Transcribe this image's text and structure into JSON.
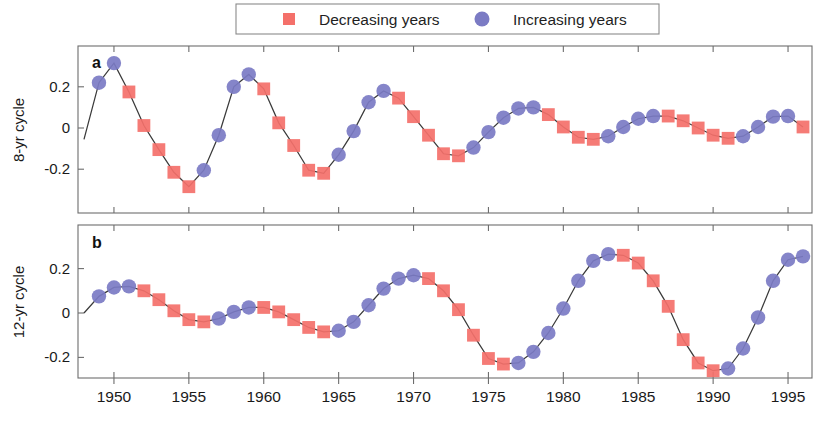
{
  "legend": {
    "entries": [
      {
        "label": "Decreasing years",
        "marker": "square-marker",
        "color": "#F4706A"
      },
      {
        "label": "Increasing years",
        "marker": "circle-marker",
        "color": "#7B7BC4"
      }
    ]
  },
  "axis": {
    "x_ticklabels": [
      "1950",
      "1955",
      "1960",
      "1965",
      "1970",
      "1975",
      "1980",
      "1985",
      "1990",
      "1995"
    ],
    "x_tickvalues": [
      1950,
      1955,
      1960,
      1965,
      1970,
      1975,
      1980,
      1985,
      1990,
      1995
    ],
    "y_ticklabels": [
      "0.2",
      "0",
      "-0.2"
    ],
    "y_tickvalues": [
      0.2,
      0,
      -0.2
    ]
  },
  "chart_data": [
    {
      "type": "line",
      "panel": "a",
      "panel_label": "a",
      "title": "",
      "xlabel": "",
      "ylabel": "8-yr cycle",
      "xlim": [
        1947.6,
        1996.6
      ],
      "ylim": [
        -0.355,
        0.395
      ],
      "grid": false,
      "legend_position": "top-center",
      "x": [
        1948,
        1949,
        1950,
        1951,
        1952,
        1953,
        1954,
        1955,
        1956,
        1957,
        1958,
        1959,
        1960,
        1961,
        1962,
        1963,
        1964,
        1965,
        1966,
        1967,
        1968,
        1969,
        1970,
        1971,
        1972,
        1973,
        1974,
        1975,
        1976,
        1977,
        1978,
        1979,
        1980,
        1981,
        1982,
        1983,
        1984,
        1985,
        1986,
        1987,
        1988,
        1989,
        1990,
        1991,
        1992,
        1993,
        1994,
        1995,
        1996
      ],
      "y": [
        -0.055,
        0.22,
        0.315,
        0.175,
        0.012,
        -0.105,
        -0.215,
        -0.285,
        -0.205,
        -0.035,
        0.2,
        0.26,
        0.19,
        0.025,
        -0.085,
        -0.205,
        -0.22,
        -0.13,
        -0.015,
        0.125,
        0.18,
        0.145,
        0.055,
        -0.035,
        -0.125,
        -0.135,
        -0.095,
        -0.02,
        0.05,
        0.095,
        0.1,
        0.065,
        0.005,
        -0.045,
        -0.055,
        -0.04,
        0.005,
        0.045,
        0.058,
        0.058,
        0.035,
        0.0,
        -0.035,
        -0.05,
        -0.04,
        0.005,
        0.055,
        0.058,
        0.005,
        -0.05
      ],
      "marker_series": [
        {
          "name": "Increasing years",
          "marker": "circle",
          "color": "#7B7BC4"
        },
        {
          "name": "Decreasing years",
          "marker": "square",
          "color": "#F4706A"
        }
      ]
    },
    {
      "type": "line",
      "panel": "b",
      "panel_label": "b",
      "title": "",
      "xlabel": "",
      "ylabel": "12-yr cycle",
      "xlim": [
        1947.6,
        1996.6
      ],
      "ylim": [
        -0.325,
        0.345
      ],
      "grid": false,
      "legend_position": "top-center",
      "x": [
        1948,
        1949,
        1950,
        1951,
        1952,
        1953,
        1954,
        1955,
        1956,
        1957,
        1958,
        1959,
        1960,
        1961,
        1962,
        1963,
        1964,
        1965,
        1966,
        1967,
        1968,
        1969,
        1970,
        1971,
        1972,
        1973,
        1974,
        1975,
        1976,
        1977,
        1978,
        1979,
        1980,
        1981,
        1982,
        1983,
        1984,
        1985,
        1986,
        1987,
        1988,
        1989,
        1990,
        1991,
        1992,
        1993,
        1994,
        1995,
        1996
      ],
      "y": [
        0.0,
        0.075,
        0.115,
        0.12,
        0.1,
        0.06,
        0.01,
        -0.03,
        -0.04,
        -0.025,
        0.005,
        0.025,
        0.025,
        0.005,
        -0.03,
        -0.065,
        -0.085,
        -0.08,
        -0.04,
        0.035,
        0.11,
        0.155,
        0.17,
        0.155,
        0.1,
        0.015,
        -0.1,
        -0.205,
        -0.23,
        -0.225,
        -0.175,
        -0.09,
        0.02,
        0.145,
        0.235,
        0.265,
        0.26,
        0.225,
        0.145,
        0.03,
        -0.12,
        -0.225,
        -0.26,
        -0.25,
        -0.16,
        -0.02,
        0.145,
        0.24,
        0.255,
        0.235,
        0.155,
        0.08,
        -0.03
      ],
      "marker_series": [
        {
          "name": "Increasing years",
          "marker": "circle",
          "color": "#7B7BC4"
        },
        {
          "name": "Decreasing years",
          "marker": "square",
          "color": "#F4706A"
        }
      ]
    }
  ],
  "style": {
    "decreasing_color": "#F4706A",
    "increasing_color": "#7B7BC4",
    "line_color": "#3a3a3a",
    "axis_color": "#6d6d6d"
  }
}
